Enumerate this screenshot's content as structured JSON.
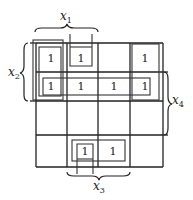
{
  "map": {
    "rows": 4,
    "cols": 4,
    "cells": [
      [
        "1",
        "1",
        "",
        "1"
      ],
      [
        "1",
        "1",
        "1",
        "1"
      ],
      [
        "",
        "",
        "",
        ""
      ],
      [
        "",
        "1",
        "1",
        ""
      ]
    ]
  },
  "variables": {
    "x1": {
      "label": "x",
      "sub": "1",
      "position": "top",
      "spans": "columns 1-2"
    },
    "x2": {
      "label": "x",
      "sub": "2",
      "position": "left",
      "spans": "rows 1-2"
    },
    "x3": {
      "label": "x",
      "sub": "3",
      "position": "bottom",
      "spans": "columns 2-3"
    },
    "x4": {
      "label": "x",
      "sub": "4",
      "position": "right",
      "spans": "rows 2-3"
    }
  },
  "loops": [
    {
      "name": "column-1-rows-1-2-outer"
    },
    {
      "name": "column-1-rows-1-2-inner"
    },
    {
      "name": "cell-r1-c2-open-top"
    },
    {
      "name": "row-2-all-columns"
    },
    {
      "name": "column-4-rows-1-2"
    },
    {
      "name": "row-4-columns-2-3"
    },
    {
      "name": "cell-r4-c2-open-bottom"
    }
  ]
}
